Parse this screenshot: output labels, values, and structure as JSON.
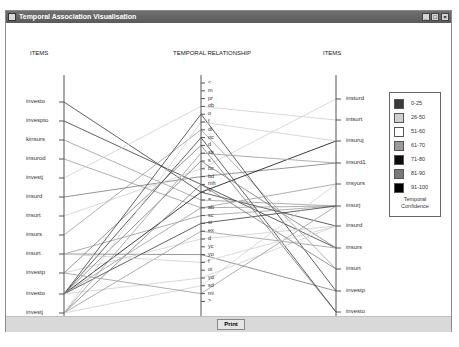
{
  "window": {
    "title": "Temporal Association Visualisation",
    "controls": {
      "minimize": "_",
      "maximize": "□",
      "close": "×"
    }
  },
  "headers": {
    "left": "ITEMS",
    "middle": "TEMPORAL RELATIONSHIP",
    "right": "ITEMS"
  },
  "left_items": [
    {
      "label": "investo",
      "y": 79
    },
    {
      "label": "invespto",
      "y": 98
    },
    {
      "label": "kinsurs",
      "y": 117
    },
    {
      "label": "insurod",
      "y": 136
    },
    {
      "label": "investj",
      "y": 155
    },
    {
      "label": "insurd",
      "y": 174
    },
    {
      "label": "insurt",
      "y": 193
    },
    {
      "label": "insurs",
      "y": 212
    },
    {
      "label": "insurt",
      "y": 231
    },
    {
      "label": "investp",
      "y": 250
    },
    {
      "label": "investo",
      "y": 271
    },
    {
      "label": "investj",
      "y": 290
    }
  ],
  "relationships": [
    {
      "label": "<",
      "y": 60
    },
    {
      "label": "m",
      "y": 67.8
    },
    {
      "label": "pr",
      "y": 75.6
    },
    {
      "label": "ob",
      "y": 83.4
    },
    {
      "label": "o",
      "y": 91.2
    },
    {
      "label": "f",
      "y": 99
    },
    {
      "label": "di",
      "y": 106.8
    },
    {
      "label": "oc",
      "y": 114.6
    },
    {
      "label": "d",
      "y": 122.4
    },
    {
      "label": "sb",
      "y": 130.2
    },
    {
      "label": "s",
      "y": 138
    },
    {
      "label": "bc",
      "y": 145.8
    },
    {
      "label": "bd",
      "y": 153.6
    },
    {
      "label": "mh",
      "y": 161.4
    },
    {
      "label": ">",
      "y": 169.2
    },
    {
      "label": "=",
      "y": 177
    },
    {
      "label": "ab",
      "y": 184.8
    },
    {
      "label": "sc",
      "y": 192.6
    },
    {
      "label": "si",
      "y": 200.4
    },
    {
      "label": "ex",
      "y": 208.2
    },
    {
      "label": "d",
      "y": 216
    },
    {
      "label": "yc",
      "y": 223.8
    },
    {
      "label": "yo",
      "y": 231.6
    },
    {
      "label": "f",
      "y": 239.4
    },
    {
      "label": "oi",
      "y": 247.2
    },
    {
      "label": "yd",
      "y": 255
    },
    {
      "label": "sd",
      "y": 262.8
    },
    {
      "label": "mi",
      "y": 270.6
    },
    {
      "label": ">",
      "y": 278.4
    }
  ],
  "right_items": [
    {
      "label": "insturd",
      "y": 76
    },
    {
      "label": "intsurt",
      "y": 97
    },
    {
      "label": "insuruj",
      "y": 118
    },
    {
      "label": "insurd1",
      "y": 140
    },
    {
      "label": "insyurs",
      "y": 161
    },
    {
      "label": "insurj",
      "y": 183
    },
    {
      "label": "insurd",
      "y": 203
    },
    {
      "label": "insurs",
      "y": 225
    },
    {
      "label": "insurt",
      "y": 246
    },
    {
      "label": "investp",
      "y": 268
    },
    {
      "label": "investo",
      "y": 289
    }
  ],
  "axes": {
    "left_x": 58,
    "middle_x": 195,
    "right_x": 330,
    "top_y": 52,
    "bottom_y": 294
  },
  "legend": {
    "title": "Temporal Confidence",
    "title_lines": [
      "Temporal",
      "Confidence"
    ],
    "entries": [
      {
        "range": "0-25",
        "color": "#3a3a3a"
      },
      {
        "range": "26-50",
        "color": "#cfcfcf"
      },
      {
        "range": "51-60",
        "color": "#ffffff"
      },
      {
        "range": "61-70",
        "color": "#9a9a9a"
      },
      {
        "range": "71-80",
        "color": "#0a0a0a"
      },
      {
        "range": "81-90",
        "color": "#7a7a7a"
      },
      {
        "range": "91-100",
        "color": "#000000"
      }
    ]
  },
  "links": [
    {
      "from_left": 0,
      "rel": 14,
      "to_right": 6,
      "color": "#3a3a3a"
    },
    {
      "from_left": 1,
      "rel": 13,
      "to_right": 7,
      "color": "#3a3a3a"
    },
    {
      "from_left": 2,
      "rel": 15,
      "to_right": 5,
      "color": "#9a9a9a"
    },
    {
      "from_left": 3,
      "rel": 16,
      "to_right": 5,
      "color": "#9a9a9a"
    },
    {
      "from_left": 4,
      "rel": 3,
      "to_right": 1,
      "color": "#cfcfcf"
    },
    {
      "from_left": 5,
      "rel": 12,
      "to_right": 3,
      "color": "#7a7a7a"
    },
    {
      "from_left": 6,
      "rel": 11,
      "to_right": 0,
      "color": "#cfcfcf"
    },
    {
      "from_left": 7,
      "rel": 6,
      "to_right": 8,
      "color": "#9a9a9a"
    },
    {
      "from_left": 8,
      "rel": 22,
      "to_right": 9,
      "color": "#7a7a7a"
    },
    {
      "from_left": 8,
      "rel": 17,
      "to_right": 5,
      "color": "#9a9a9a"
    },
    {
      "from_left": 9,
      "rel": 8,
      "to_right": 10,
      "color": "#7a7a7a"
    },
    {
      "from_left": 9,
      "rel": 20,
      "to_right": 6,
      "color": "#cfcfcf"
    },
    {
      "from_left": 10,
      "rel": 4,
      "to_right": 9,
      "color": "#3a3a3a"
    },
    {
      "from_left": 10,
      "rel": 7,
      "to_right": 10,
      "color": "#3a3a3a"
    },
    {
      "from_left": 10,
      "rel": 14,
      "to_right": 2,
      "color": "#0a0a0a"
    },
    {
      "from_left": 10,
      "rel": 18,
      "to_right": 5,
      "color": "#3a3a3a"
    },
    {
      "from_left": 10,
      "rel": 10,
      "to_right": 7,
      "color": "#7a7a7a"
    },
    {
      "from_left": 10,
      "rel": 16,
      "to_right": 4,
      "color": "#9a9a9a"
    },
    {
      "from_left": 10,
      "rel": 25,
      "to_right": 6,
      "color": "#cfcfcf"
    },
    {
      "from_left": 11,
      "rel": 9,
      "to_right": 3,
      "color": "#9a9a9a"
    },
    {
      "from_left": 11,
      "rel": 13,
      "to_right": 8,
      "color": "#7a7a7a"
    },
    {
      "from_left": 11,
      "rel": 19,
      "to_right": 7,
      "color": "#9a9a9a"
    },
    {
      "from_left": 11,
      "rel": 26,
      "to_right": 4,
      "color": "#cfcfcf"
    },
    {
      "from_left": 11,
      "rel": 5,
      "to_right": 2,
      "color": "#cfcfcf"
    },
    {
      "from_left": 9,
      "rel": 27,
      "to_right": 5,
      "color": "#9a9a9a"
    },
    {
      "from_left": 8,
      "rel": 23,
      "to_right": 6,
      "color": "#cfcfcf"
    }
  ],
  "footer": {
    "print_label": "Print"
  }
}
